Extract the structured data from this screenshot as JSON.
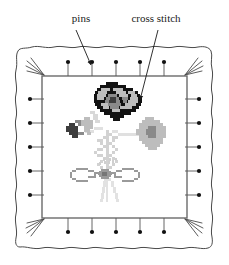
{
  "figure": {
    "background_color": "#ffffff"
  },
  "labels": [
    {
      "id": "pins",
      "text": "pins",
      "x": 81,
      "y": 22,
      "anchor": "middle"
    },
    {
      "id": "cross-stitch",
      "text": "cross stitch",
      "x": 156,
      "y": 22,
      "anchor": "middle"
    }
  ],
  "leaders": [
    {
      "id": "pins-leader",
      "from": [
        76,
        30
      ],
      "to": [
        91,
        66
      ],
      "color": "#1a1a1a"
    },
    {
      "id": "cross-stitch-leader",
      "from": [
        158,
        30
      ],
      "to": [
        140,
        101
      ],
      "color": "#1a1a1a"
    }
  ],
  "fabric": {
    "name": "fabric-sheet",
    "fill": "#ffffff",
    "stroke": "#4a4a4a",
    "stroke_width": 1,
    "bounds": {
      "x": 16,
      "y": 46,
      "width": 197,
      "height": 203
    }
  },
  "inner_frame": {
    "name": "stitch-area-frame",
    "fill": "#ffffff",
    "stroke": "#6b6b6b",
    "stroke_width": 1.4,
    "bounds": {
      "x": 42,
      "y": 76,
      "width": 145,
      "height": 142
    }
  },
  "corner_frays": {
    "color": "#4a4a4a",
    "count_per_corner": 4,
    "corners": [
      "top-left",
      "top-right",
      "bottom-left",
      "bottom-right"
    ]
  },
  "pins": {
    "head_color": "#111111",
    "stem_color": "#555555",
    "head_radius": 2.1,
    "stem_length": 14,
    "top": [
      {
        "x": 68,
        "y": 62
      },
      {
        "x": 92,
        "y": 62
      },
      {
        "x": 116,
        "y": 62
      },
      {
        "x": 140,
        "y": 62
      },
      {
        "x": 164,
        "y": 62
      }
    ],
    "bottom": [
      {
        "x": 68,
        "y": 232
      },
      {
        "x": 92,
        "y": 232
      },
      {
        "x": 116,
        "y": 232
      },
      {
        "x": 140,
        "y": 232
      },
      {
        "x": 164,
        "y": 232
      }
    ],
    "left": [
      {
        "x": 30,
        "y": 99
      },
      {
        "x": 30,
        "y": 123
      },
      {
        "x": 30,
        "y": 147
      },
      {
        "x": 30,
        "y": 171
      },
      {
        "x": 30,
        "y": 195
      }
    ],
    "right": [
      {
        "x": 199,
        "y": 99
      },
      {
        "x": 199,
        "y": 123
      },
      {
        "x": 199,
        "y": 147
      },
      {
        "x": 199,
        "y": 171
      },
      {
        "x": 199,
        "y": 195
      }
    ]
  },
  "embroidery": {
    "name": "cross-stitch-motif",
    "description": "pixelated floral bouquet with poppy, round blossom, leaves and a ribbon bow",
    "cell_size": 2.6,
    "palette": {
      "outline": "#121212",
      "dark": "#3d3d3d",
      "mid": "#8a8a8a",
      "light": "#bdbdbd",
      "pale": "#d8d8d8",
      "faint": "#e6e6e6"
    },
    "parts": [
      {
        "name": "poppy-flower",
        "color_keys": [
          "outline",
          "light",
          "mid"
        ]
      },
      {
        "name": "round-blossom",
        "color_keys": [
          "light",
          "mid"
        ]
      },
      {
        "name": "left-leaves",
        "color_keys": [
          "dark",
          "mid",
          "pale"
        ]
      },
      {
        "name": "stem-foliage",
        "color_keys": [
          "pale",
          "light"
        ]
      },
      {
        "name": "ribbon-bow",
        "color_keys": [
          "mid",
          "light"
        ]
      }
    ]
  }
}
